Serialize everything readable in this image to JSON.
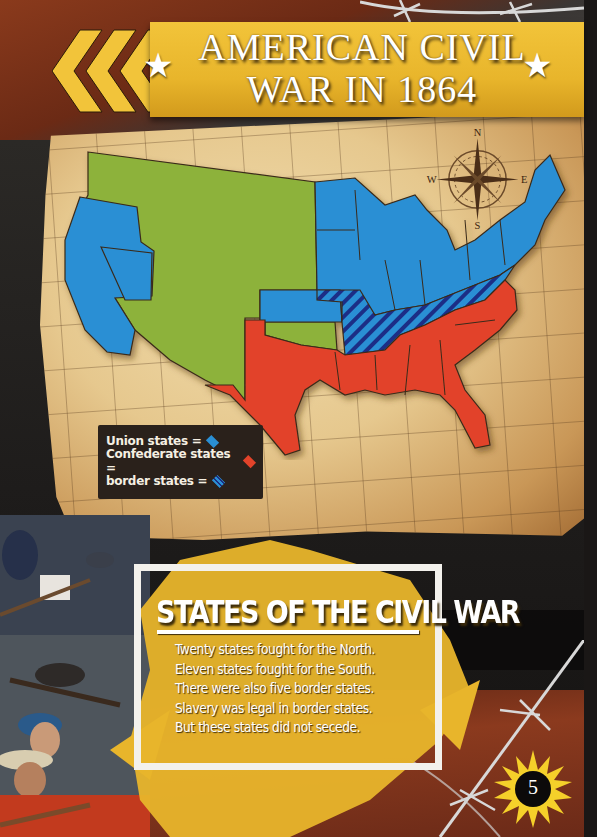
{
  "page": {
    "title_line1": "AMERICAN CIVIL",
    "title_line2": "WAR IN 1864",
    "page_number": "5"
  },
  "compass": {
    "north": "N",
    "south": "S",
    "east": "E",
    "west": "W"
  },
  "legend": {
    "items": [
      {
        "label": "Union states =",
        "color": "#2a8fd4",
        "icon": "blue-diamond-icon"
      },
      {
        "label": "Confederate states =",
        "color": "#e2432a",
        "icon": "red-diamond-icon"
      },
      {
        "label": "border states =",
        "color": "#2a8fd4",
        "icon": "striped-diamond-icon"
      }
    ]
  },
  "map": {
    "colors": {
      "union": "#2a8fd4",
      "confederate": "#e2432a",
      "territory": "#8db23a",
      "border_stripe": "#1b2f86"
    }
  },
  "textbox": {
    "heading": "STATES OF THE CIVIL WAR",
    "lines": [
      "Twenty states fought for the North.",
      "Eleven states fought for the South.",
      "There were also five border states.",
      "Slavery was legal in border states.",
      "But these states did not secede."
    ]
  }
}
